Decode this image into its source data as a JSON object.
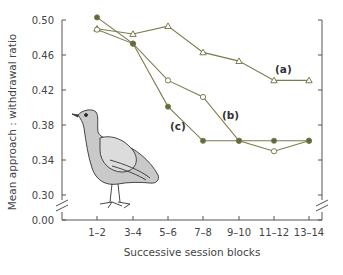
{
  "chart_data": {
    "type": "line",
    "title": "",
    "xlabel": "Successive session blocks",
    "ylabel": "Mean approach : withdrawal ratio",
    "categories": [
      "1–2",
      "3–4",
      "5–6",
      "7–8",
      "9–10",
      "11–12",
      "13–14"
    ],
    "y_ticks": [
      "0.50",
      "0.46",
      "0.42",
      "0.38",
      "0.34",
      "0.30",
      "0.00"
    ],
    "ylim": [
      0.28,
      0.5
    ],
    "y_axis_break": true,
    "grid": false,
    "series": [
      {
        "name": "(a)",
        "marker": "open-triangle",
        "values": [
          0.49,
          0.484,
          0.493,
          0.463,
          0.453,
          0.431,
          0.431
        ]
      },
      {
        "name": "(b)",
        "marker": "open-circle",
        "values": [
          0.489,
          0.473,
          0.431,
          0.412,
          0.362,
          0.35,
          0.362
        ]
      },
      {
        "name": "(c)",
        "marker": "filled-circle",
        "values": [
          0.503,
          0.473,
          0.401,
          0.362,
          0.362,
          0.362,
          0.362
        ]
      }
    ],
    "annotations": [
      "(a)",
      "(b)",
      "(c)",
      "pigeon illustration"
    ]
  },
  "colors": {
    "line": "#7c7a4e",
    "marker_fill": "#5f6b3a",
    "axis": "#555555"
  }
}
